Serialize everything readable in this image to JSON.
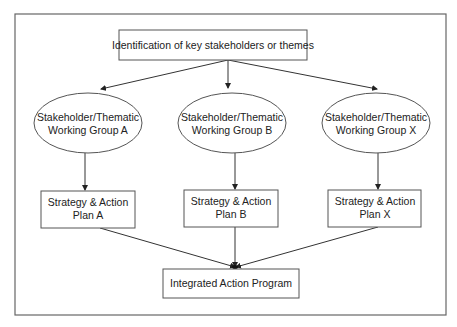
{
  "diagram": {
    "type": "flowchart",
    "top_node": {
      "id": "identify",
      "label": "Identification of key stakeholders or themes"
    },
    "working_groups": [
      {
        "id": "wg-a",
        "lines": [
          "Stakeholder/Thematic",
          "Working Group A"
        ]
      },
      {
        "id": "wg-b",
        "lines": [
          "Stakeholder/Thematic",
          "Working Group B"
        ]
      },
      {
        "id": "wg-x",
        "lines": [
          "Stakeholder/Thematic",
          "Working Group X"
        ]
      }
    ],
    "plans": [
      {
        "id": "plan-a",
        "lines": [
          "Strategy & Action",
          "Plan A"
        ]
      },
      {
        "id": "plan-b",
        "lines": [
          "Strategy & Action",
          "Plan B"
        ]
      },
      {
        "id": "plan-x",
        "lines": [
          "Strategy & Action",
          "Plan X"
        ]
      }
    ],
    "bottom_node": {
      "id": "integrated",
      "label": "Integrated Action Program"
    },
    "edges": [
      {
        "from": "identify",
        "to": "wg-a"
      },
      {
        "from": "identify",
        "to": "wg-b"
      },
      {
        "from": "identify",
        "to": "wg-x"
      },
      {
        "from": "wg-a",
        "to": "plan-a"
      },
      {
        "from": "wg-b",
        "to": "plan-b"
      },
      {
        "from": "wg-x",
        "to": "plan-x"
      },
      {
        "from": "plan-a",
        "to": "integrated"
      },
      {
        "from": "plan-b",
        "to": "integrated"
      },
      {
        "from": "plan-x",
        "to": "integrated"
      }
    ]
  }
}
